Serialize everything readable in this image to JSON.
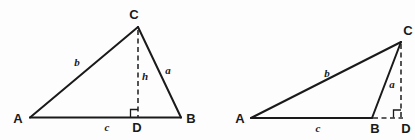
{
  "figure": {
    "background_color": "#fdfdfd",
    "line_color": "#1a1a1a",
    "panels": [
      {
        "id": "acute-triangle",
        "name": "Acute triangle with interior altitude",
        "vertex_labels": {
          "A": "A",
          "B": "B",
          "C": "C",
          "D": "D"
        },
        "side_labels": {
          "a": "a",
          "b": "b",
          "c": "c",
          "h": "h"
        },
        "has_right_angle_marker": true,
        "altitude_style": "dashed"
      },
      {
        "id": "obtuse-triangle",
        "name": "Obtuse triangle with exterior altitude",
        "vertex_labels": {
          "A": "A",
          "B": "B",
          "C": "C",
          "D": "D"
        },
        "side_labels": {
          "a": "a",
          "b": "b",
          "c": "c"
        },
        "has_right_angle_marker": true,
        "altitude_style": "dashed"
      }
    ]
  }
}
